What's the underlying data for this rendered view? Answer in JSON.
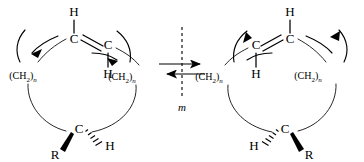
{
  "figure": {
    "background_color": "#ffffff",
    "ink_color": "#000000",
    "width": 364,
    "height": 162
  },
  "center": {
    "mirror_label": "m",
    "mirror_plane_name": "mirror-plane-dashed-line",
    "equilibrium_top_arrow": "forward-arrow-right",
    "equilibrium_bottom_arrow": "reverse-arrow-left"
  },
  "left_structure": {
    "name": "macrocyclic-alkene-conformer-left",
    "alkene": {
      "carbon_upper_label": "C",
      "carbon_lower_label": "C",
      "hydrogen_upper_label": "H",
      "hydrogen_lower_label": "H",
      "bond_type": "cis-double-bond"
    },
    "chain_left_label": "(CH",
    "chain_left_sub": "2",
    "chain_left_close": ")",
    "chain_left_n": "n",
    "chain_right_label": "(CH",
    "chain_right_sub": "2",
    "chain_right_close": ")",
    "chain_right_n": "n",
    "stereocenter": {
      "carbon_label": "C",
      "wedge_substituent": "R",
      "hash_substituent": "H",
      "wedge_direction": "lower-left",
      "hash_direction": "lower-right"
    },
    "rotation_arrows": {
      "left_arrow_direction": "down-left",
      "right_arrow_direction": "down-right"
    }
  },
  "right_structure": {
    "name": "macrocyclic-alkene-conformer-right",
    "alkene": {
      "carbon_upper_label": "C",
      "carbon_lower_label": "C",
      "hydrogen_upper_label": "H",
      "hydrogen_lower_label": "H",
      "bond_type": "cis-double-bond"
    },
    "chain_left_label": "(CH",
    "chain_left_sub": "2",
    "chain_left_close": ")",
    "chain_left_n": "n",
    "chain_right_label": "(CH",
    "chain_right_sub": "2",
    "chain_right_close": ")",
    "chain_right_n": "n",
    "stereocenter": {
      "carbon_label": "C",
      "wedge_substituent": "R",
      "hash_substituent": "H",
      "wedge_direction": "lower-right",
      "hash_direction": "lower-left"
    },
    "rotation_arrows": {
      "left_arrow_direction": "up-left",
      "right_arrow_direction": "up-right"
    }
  }
}
